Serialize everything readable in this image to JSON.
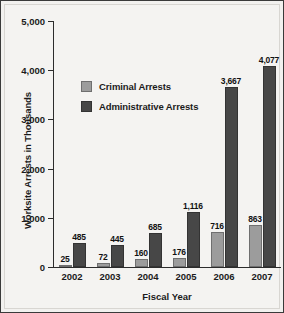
{
  "chart_data": {
    "type": "bar",
    "title": "",
    "xlabel": "Fiscal Year",
    "ylabel": "Worksite Arrests in Thousands",
    "categories": [
      "2002",
      "2003",
      "2004",
      "2005",
      "2006",
      "2007"
    ],
    "series": [
      {
        "name": "Criminal Arrests",
        "color": "#9c9c9c",
        "values": [
          25,
          72,
          160,
          176,
          716,
          863
        ],
        "labels": [
          "25",
          "72",
          "160",
          "176",
          "716",
          "863"
        ]
      },
      {
        "name": "Administrative Arrests",
        "color": "#474747",
        "values": [
          485,
          445,
          685,
          1116,
          3667,
          4077
        ],
        "labels": [
          "485",
          "445",
          "685",
          "1,116",
          "3,667",
          "4,077"
        ]
      }
    ],
    "ylim": [
      0,
      5000
    ],
    "yticks": [
      0,
      1000,
      2000,
      3000,
      4000,
      5000
    ],
    "ytick_labels": [
      "0",
      "1,000",
      "2,000",
      "3,000",
      "4,000",
      "5,000"
    ],
    "grid": false,
    "legend_position": "upper-left-inside"
  },
  "legend": {
    "items": [
      {
        "label": "Criminal Arrests"
      },
      {
        "label": "Administrative Arrests"
      }
    ]
  },
  "colors": {
    "criminal": "#9c9c9c",
    "administrative": "#474747",
    "axis": "#2c2c2c",
    "background": "#f4f3f1",
    "border": "#3a3a3a"
  }
}
